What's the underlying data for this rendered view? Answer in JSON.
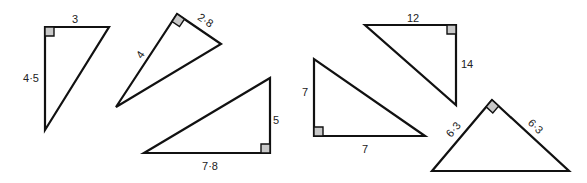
{
  "figure": {
    "triangles": [
      {
        "id": "t1",
        "sides": [
          "3",
          "4·5"
        ],
        "points": [
          [
            45,
            27
          ],
          [
            109,
            27
          ],
          [
            45,
            130
          ]
        ],
        "right_angle": {
          "x": 45,
          "y": 27,
          "rot": 0
        },
        "labels": [
          {
            "text": "3",
            "x": 75,
            "y": 20,
            "rot": 0
          },
          {
            "text": "4·5",
            "x": 31,
            "y": 79,
            "rot": 0
          }
        ]
      },
      {
        "id": "t2",
        "sides": [
          "4",
          "2·8"
        ],
        "points": [
          [
            177,
            14
          ],
          [
            221,
            44
          ],
          [
            116,
            107
          ]
        ],
        "right_angle": {
          "x": 177,
          "y": 14,
          "rot": 34
        },
        "labels": [
          {
            "text": "4",
            "x": 141,
            "y": 55,
            "rot": -56
          },
          {
            "text": "2·8",
            "x": 205,
            "y": 21,
            "rot": 34
          }
        ]
      },
      {
        "id": "t3",
        "sides": [
          "5",
          "7·8"
        ],
        "points": [
          [
            144,
            153
          ],
          [
            270,
            78
          ],
          [
            270,
            153
          ]
        ],
        "right_angle": {
          "x": 270,
          "y": 153,
          "rot": 180
        },
        "labels": [
          {
            "text": "5",
            "x": 276,
            "y": 121,
            "rot": 0
          },
          {
            "text": "7·8",
            "x": 210,
            "y": 167,
            "rot": 0
          }
        ]
      },
      {
        "id": "t4",
        "sides": [
          "7",
          "7"
        ],
        "points": [
          [
            314,
            59
          ],
          [
            314,
            136
          ],
          [
            425,
            136
          ]
        ],
        "right_angle": {
          "x": 314,
          "y": 136,
          "rot": 270
        },
        "labels": [
          {
            "text": "7",
            "x": 305,
            "y": 93,
            "rot": 0
          },
          {
            "text": "7",
            "x": 365,
            "y": 150,
            "rot": 0
          }
        ]
      },
      {
        "id": "t5",
        "sides": [
          "12",
          "14"
        ],
        "points": [
          [
            365,
            25
          ],
          [
            456,
            25
          ],
          [
            456,
            105
          ]
        ],
        "right_angle": {
          "x": 456,
          "y": 25,
          "rot": 90
        },
        "labels": [
          {
            "text": "12",
            "x": 413,
            "y": 19,
            "rot": 0
          },
          {
            "text": "14",
            "x": 467,
            "y": 65,
            "rot": 0
          }
        ]
      },
      {
        "id": "t6",
        "sides": [
          "6·3",
          "6·3"
        ],
        "points": [
          [
            492,
            100
          ],
          [
            432,
            171
          ],
          [
            569,
            171
          ]
        ],
        "right_angle": {
          "x": 492,
          "y": 100,
          "rot": 45
        },
        "labels": [
          {
            "text": "6·3",
            "x": 454,
            "y": 130,
            "rot": -50
          },
          {
            "text": "6·3",
            "x": 535,
            "y": 127,
            "rot": 45
          }
        ]
      }
    ]
  }
}
